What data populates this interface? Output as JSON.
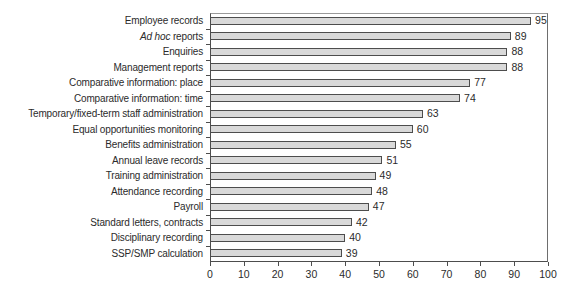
{
  "chart_data": {
    "type": "bar",
    "orientation": "horizontal",
    "title": "",
    "xlabel": "",
    "ylabel": "",
    "categories": [
      "Employee records",
      "Ad hoc reports",
      "Enquiries",
      "Management reports",
      "Comparative information: place",
      "Comparative information: time",
      "Temporary/fixed-term staff administration",
      "Equal opportunities monitoring",
      "Benefits administration",
      "Annual leave records",
      "Training administration",
      "Attendance recording",
      "Payroll",
      "Standard letters, contracts",
      "Disciplinary recording",
      "SSP/SMP calculation"
    ],
    "values": [
      95,
      89,
      88,
      88,
      77,
      74,
      63,
      60,
      55,
      51,
      49,
      48,
      47,
      42,
      40,
      39
    ],
    "italic_category_index": 1,
    "italic_prefix": "Ad hoc",
    "xlim": [
      0,
      100
    ],
    "x_ticks": [
      0,
      10,
      20,
      30,
      40,
      50,
      60,
      70,
      80,
      90,
      100
    ],
    "grid": false,
    "legend": false,
    "data_labels": "outside-end",
    "colors": {
      "bar_fill": "#d9d9d9",
      "bar_border": "#4d4d4d",
      "axis": "#4d4d4d",
      "text": "#2b2b2b",
      "background": "#ffffff"
    }
  }
}
